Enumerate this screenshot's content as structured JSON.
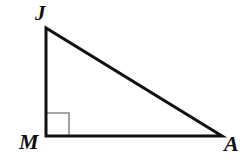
{
  "figure": {
    "kind": "right-triangle-diagram",
    "background_color": "#ffffff",
    "stroke_color": "#111111",
    "stroke_width": 3,
    "canvas": {
      "width": 248,
      "height": 167
    },
    "vertices": [
      {
        "id": "J",
        "label": "J",
        "x": 46,
        "y": 28
      },
      {
        "id": "M",
        "label": "M",
        "x": 46,
        "y": 136
      },
      {
        "id": "A",
        "label": "A",
        "x": 222,
        "y": 136
      }
    ],
    "sides": [
      {
        "id": "JM",
        "from": "J",
        "to": "M",
        "name": "leg-vertical"
      },
      {
        "id": "MA",
        "from": "M",
        "to": "A",
        "name": "leg-horizontal"
      },
      {
        "id": "JA",
        "from": "J",
        "to": "A",
        "name": "hypotenuse"
      }
    ],
    "right_angle": {
      "at_vertex": "M",
      "marker": "square",
      "size": 23,
      "color": "#8a8a8a",
      "stroke_width": 1.6
    },
    "labels": {
      "J": "J",
      "M": "M",
      "A": "A"
    }
  }
}
